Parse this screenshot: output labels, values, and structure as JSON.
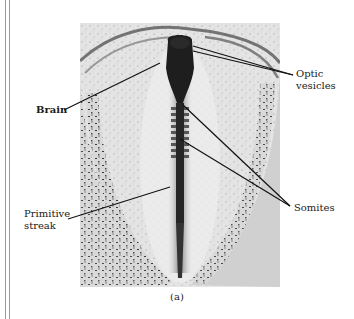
{
  "figure": {
    "caption": "(a)",
    "labels": {
      "brain": "Brain",
      "optic_vesicles_line1": "Optic",
      "optic_vesicles_line2": "vesicles",
      "somites": "Somites",
      "primitive_streak_line1": "Primitive",
      "primitive_streak_line2": "streak"
    },
    "colors": {
      "background": "#ffffff",
      "tissue": "#e6e6e6",
      "stain": "#1a1a1a",
      "leader_line": "#111111",
      "border_lines": "#9a9a9a"
    }
  }
}
